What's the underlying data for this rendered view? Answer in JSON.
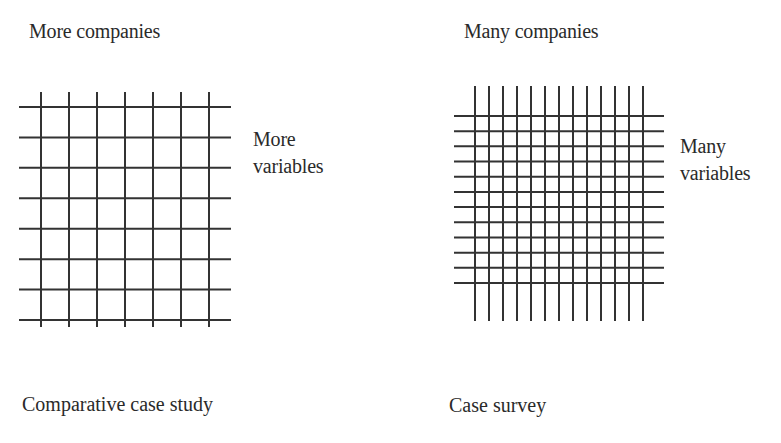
{
  "left_panel": {
    "top_label": "More companies",
    "side_label_line1": "More",
    "side_label_line2": "variables",
    "caption": "Comparative case study",
    "grid": {
      "vertical_lines": 7,
      "horizontal_lines": 8,
      "h_x1": 19,
      "h_x2": 231,
      "h_y_start": 107,
      "h_y_end": 320,
      "v_y1": 92,
      "v_y2": 327,
      "v_x_start": 41,
      "v_x_end": 209
    }
  },
  "right_panel": {
    "top_label": "Many companies",
    "side_label_line1": "Many",
    "side_label_line2": "variables",
    "caption": "Case survey",
    "grid": {
      "vertical_lines": 13,
      "horizontal_lines": 12,
      "h_x1": 454,
      "h_x2": 664,
      "h_y_start": 116,
      "h_y_end": 283,
      "v_y1": 86,
      "v_y2": 321,
      "v_x_start": 475,
      "v_x_end": 643
    }
  },
  "colors": {
    "line": "#333333",
    "text": "#2a2a2a",
    "background": "#ffffff"
  }
}
